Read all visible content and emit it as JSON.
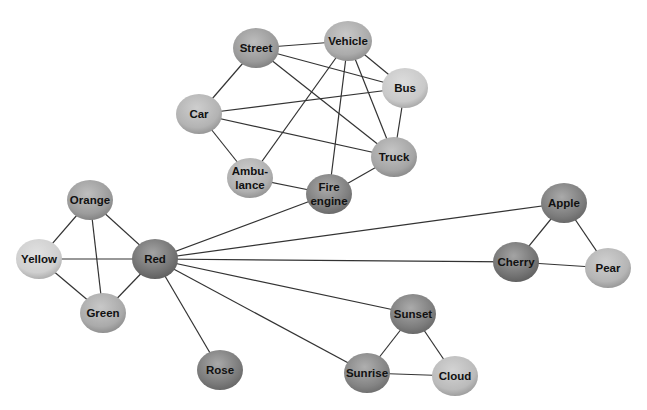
{
  "diagram": {
    "type": "network-graph",
    "nodes": [
      {
        "id": "street",
        "label": [
          "Street"
        ],
        "x": 256,
        "y": 48,
        "rx": 23,
        "ry": 20,
        "shade": "#9a9a9a"
      },
      {
        "id": "vehicle",
        "label": [
          "Vehicle"
        ],
        "x": 348,
        "y": 41,
        "rx": 24,
        "ry": 20,
        "shade": "#ababab"
      },
      {
        "id": "bus",
        "label": [
          "Bus"
        ],
        "x": 405,
        "y": 88,
        "rx": 23,
        "ry": 20,
        "shade": "#c9c9c9"
      },
      {
        "id": "car",
        "label": [
          "Car"
        ],
        "x": 199,
        "y": 114,
        "rx": 23,
        "ry": 20,
        "shade": "#b3b3b3"
      },
      {
        "id": "truck",
        "label": [
          "Truck"
        ],
        "x": 394,
        "y": 157,
        "rx": 23,
        "ry": 20,
        "shade": "#a5a5a5"
      },
      {
        "id": "ambulance",
        "label": [
          "Ambu-",
          "lance"
        ],
        "x": 250,
        "y": 178,
        "rx": 23,
        "ry": 20,
        "shade": "#b0b0b0"
      },
      {
        "id": "fire",
        "label": [
          "Fire",
          "engine"
        ],
        "x": 329,
        "y": 194,
        "rx": 23,
        "ry": 20,
        "shade": "#7e7e7e"
      },
      {
        "id": "orange",
        "label": [
          "Orange"
        ],
        "x": 90,
        "y": 200,
        "rx": 23,
        "ry": 20,
        "shade": "#9c9c9c"
      },
      {
        "id": "yellow",
        "label": [
          "Yellow"
        ],
        "x": 39,
        "y": 259,
        "rx": 23,
        "ry": 20,
        "shade": "#cfcfcf"
      },
      {
        "id": "red",
        "label": [
          "Red"
        ],
        "x": 155,
        "y": 259,
        "rx": 23,
        "ry": 20,
        "shade": "#727272"
      },
      {
        "id": "green",
        "label": [
          "Green"
        ],
        "x": 103,
        "y": 313,
        "rx": 23,
        "ry": 20,
        "shade": "#aaaaaa"
      },
      {
        "id": "rose",
        "label": [
          "Rose"
        ],
        "x": 220,
        "y": 370,
        "rx": 23,
        "ry": 20,
        "shade": "#7a7a7a"
      },
      {
        "id": "apple",
        "label": [
          "Apple"
        ],
        "x": 564,
        "y": 203,
        "rx": 23,
        "ry": 20,
        "shade": "#7c7c7c"
      },
      {
        "id": "cherry",
        "label": [
          "Cherry"
        ],
        "x": 516,
        "y": 262,
        "rx": 23,
        "ry": 20,
        "shade": "#737373"
      },
      {
        "id": "pear",
        "label": [
          "Pear"
        ],
        "x": 608,
        "y": 268,
        "rx": 23,
        "ry": 20,
        "shade": "#b5b5b5"
      },
      {
        "id": "sunset",
        "label": [
          "Sunset"
        ],
        "x": 413,
        "y": 314,
        "rx": 23,
        "ry": 20,
        "shade": "#7d7d7d"
      },
      {
        "id": "sunrise",
        "label": [
          "Sunrise"
        ],
        "x": 367,
        "y": 373,
        "rx": 23,
        "ry": 20,
        "shade": "#848484"
      },
      {
        "id": "cloud",
        "label": [
          "Cloud"
        ],
        "x": 455,
        "y": 376,
        "rx": 23,
        "ry": 20,
        "shade": "#bbbbbb"
      }
    ],
    "edges": [
      [
        "street",
        "vehicle"
      ],
      [
        "street",
        "car"
      ],
      [
        "street",
        "bus"
      ],
      [
        "street",
        "truck"
      ],
      [
        "vehicle",
        "bus"
      ],
      [
        "vehicle",
        "truck"
      ],
      [
        "vehicle",
        "ambulance"
      ],
      [
        "vehicle",
        "fire"
      ],
      [
        "car",
        "bus"
      ],
      [
        "car",
        "truck"
      ],
      [
        "car",
        "ambulance"
      ],
      [
        "bus",
        "truck"
      ],
      [
        "truck",
        "fire"
      ],
      [
        "ambulance",
        "fire"
      ],
      [
        "fire",
        "red"
      ],
      [
        "red",
        "orange"
      ],
      [
        "red",
        "yellow"
      ],
      [
        "red",
        "green"
      ],
      [
        "red",
        "rose"
      ],
      [
        "red",
        "apple"
      ],
      [
        "red",
        "cherry"
      ],
      [
        "red",
        "sunset"
      ],
      [
        "red",
        "sunrise"
      ],
      [
        "orange",
        "yellow"
      ],
      [
        "orange",
        "green"
      ],
      [
        "yellow",
        "green"
      ],
      [
        "apple",
        "cherry"
      ],
      [
        "apple",
        "pear"
      ],
      [
        "cherry",
        "pear"
      ],
      [
        "sunset",
        "sunrise"
      ],
      [
        "sunset",
        "cloud"
      ],
      [
        "sunrise",
        "cloud"
      ]
    ],
    "edge_color": "#333333"
  }
}
